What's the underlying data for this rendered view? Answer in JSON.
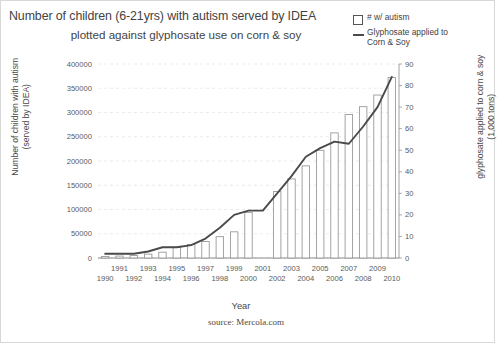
{
  "title": {
    "line1": "Number of children (6-21yrs) with autism served by IDEA",
    "line2": "plotted against glyphosate use on corn & soy"
  },
  "legend": {
    "items": [
      {
        "label": "# w/ autism",
        "marker": "bar-swatch-icon",
        "color": "#555555"
      },
      {
        "label": "Glyphosate applied to\nCorn & Soy",
        "marker": "line-swatch-icon",
        "color": "#4a4a4a"
      }
    ]
  },
  "source": "source: Mercola.com",
  "chart_data": {
    "type": "bar",
    "title": "Number of children (6-21yrs) with autism served by IDEA plotted against glyphosate use on corn & soy",
    "xlabel": "Year",
    "ylabel": "Number of children with autism (served by IDEA)",
    "y2label": "glyphosate applied to corn & soy (1,000 tons)",
    "categories": [
      1990,
      1991,
      1992,
      1993,
      1994,
      1995,
      1996,
      1997,
      1998,
      1999,
      2000,
      2001,
      2002,
      2003,
      2004,
      2005,
      2006,
      2007,
      2008,
      2009,
      2010
    ],
    "xtick_labels_row1": [
      "",
      "1991",
      "",
      "1993",
      "",
      "1995",
      "",
      "1997",
      "",
      "1999",
      "",
      "2001",
      "",
      "2003",
      "",
      "2005",
      "",
      "2007",
      "",
      "2009",
      ""
    ],
    "xtick_labels_row2": [
      "1990",
      "",
      "1992",
      "",
      "1994",
      "",
      "1996",
      "",
      "1998",
      "",
      "2000",
      "",
      "2002",
      "",
      "2004",
      "",
      "2006",
      "",
      "2008",
      "",
      "2010"
    ],
    "ylim": [
      0,
      400000
    ],
    "yticks": [
      0,
      50000,
      100000,
      150000,
      200000,
      250000,
      300000,
      350000,
      400000
    ],
    "y2lim": [
      0,
      90
    ],
    "y2ticks": [
      0,
      10,
      20,
      30,
      40,
      50,
      60,
      70,
      80,
      90
    ],
    "grid": true,
    "legend_position": "top-right",
    "series": [
      {
        "name": "# w/ autism",
        "type": "bar",
        "axis": "left",
        "values": [
          3000,
          4000,
          5000,
          8000,
          12000,
          22000,
          28000,
          34000,
          44000,
          54000,
          94000,
          0,
          137000,
          163000,
          190000,
          222000,
          258000,
          296000,
          312000,
          336000,
          372000
        ]
      },
      {
        "name": "Glyphosate applied to Corn & Soy",
        "type": "line",
        "axis": "right",
        "values": [
          2,
          2,
          2,
          3,
          5,
          5,
          6,
          9,
          14,
          20,
          22,
          22,
          30,
          38,
          47,
          51,
          54,
          53,
          61,
          70,
          84
        ]
      }
    ]
  },
  "colors": {
    "bar_stroke": "#9a9a9a",
    "bar_fill": "#ffffff",
    "line": "#4a4a4a",
    "grid": "#e6e6e6",
    "axis": "#8a8a8a",
    "text": "#4a4a4a"
  }
}
